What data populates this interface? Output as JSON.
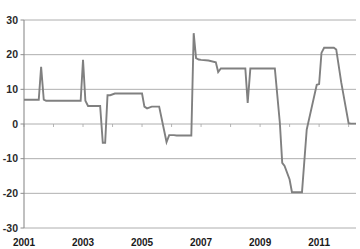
{
  "chart_data": {
    "type": "line",
    "title": "",
    "xlabel": "",
    "ylabel": "",
    "ylim": [
      -30,
      30
    ],
    "xlim": [
      2001,
      2012.25
    ],
    "grid": true,
    "legend": false,
    "y_ticks": [
      30,
      20,
      10,
      0,
      -10,
      -20,
      -30
    ],
    "x_ticks": [
      2001,
      2003,
      2005,
      2007,
      2009,
      2011
    ],
    "x_tick_labels": [
      "2001",
      "2003",
      "2005",
      "2007",
      "2009",
      "2011"
    ],
    "y_tick_labels": [
      "30",
      "20",
      "10",
      "0",
      "-10",
      "-20",
      "-30"
    ],
    "series": [
      {
        "name": "series-1",
        "color": "#808080",
        "x": [
          2001.0,
          2001.25,
          2001.5,
          2001.58,
          2001.67,
          2001.75,
          2001.83,
          2002.0,
          2002.5,
          2002.92,
          2003.0,
          2003.08,
          2003.17,
          2003.25,
          2003.5,
          2003.58,
          2003.67,
          2003.75,
          2003.83,
          2003.92,
          2004.08,
          2004.25,
          2004.5,
          2004.75,
          2005.0,
          2005.08,
          2005.17,
          2005.33,
          2005.58,
          2005.83,
          2005.92,
          2006.0,
          2006.08,
          2006.17,
          2006.33,
          2006.67,
          2006.75,
          2006.83,
          2006.92,
          2007.0,
          2007.25,
          2007.5,
          2007.58,
          2007.67,
          2007.83,
          2008.0,
          2008.5,
          2008.58,
          2008.67,
          2008.75,
          2009.0,
          2009.5,
          2009.67,
          2009.75,
          2009.83,
          2010.0,
          2010.08,
          2010.25,
          2010.42,
          2010.58,
          2010.92,
          2011.0,
          2011.08,
          2011.17,
          2011.25,
          2011.42,
          2011.5,
          2011.58,
          2011.75,
          2012.0,
          2012.08,
          2012.17,
          2012.25
        ],
        "y": [
          7.0,
          7.0,
          7.0,
          16.5,
          7.0,
          6.7,
          6.7,
          6.7,
          6.7,
          6.7,
          18.5,
          6.7,
          5.2,
          5.2,
          5.2,
          5.2,
          -5.4,
          -5.4,
          8.3,
          8.3,
          8.8,
          8.8,
          8.8,
          8.8,
          8.8,
          5.0,
          4.5,
          5.0,
          5.0,
          -5.2,
          -3.2,
          -3.2,
          -3.2,
          -3.3,
          -3.3,
          -3.3,
          26.2,
          19.0,
          18.6,
          18.5,
          18.3,
          17.8,
          15.0,
          16.0,
          16.0,
          16.0,
          16.0,
          6.1,
          16.0,
          16.0,
          16.0,
          16.0,
          0.3,
          -11.2,
          -12.1,
          -16.0,
          -19.7,
          -19.7,
          -19.7,
          -1.6,
          11.3,
          11.5,
          20.5,
          22.0,
          22.0,
          22.0,
          22.0,
          21.5,
          12.0,
          0.2,
          0.1,
          0.1,
          0.1
        ]
      }
    ]
  },
  "axes": {
    "plot_left": 24,
    "plot_right": 356,
    "plot_top": 20,
    "plot_bottom": 228
  }
}
